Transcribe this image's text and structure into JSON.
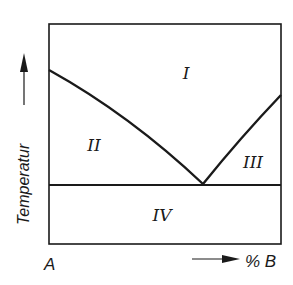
{
  "diagram": {
    "type": "binary-eutectic-phase-diagram",
    "y_axis": {
      "label": "Temperatur",
      "arrow": "up-arrow"
    },
    "x_axis": {
      "left_label": "A",
      "right_label": "% B",
      "arrow": "right-arrow"
    },
    "regions": [
      {
        "id": "I",
        "label": "I"
      },
      {
        "id": "II",
        "label": "II"
      },
      {
        "id": "III",
        "label": "III"
      },
      {
        "id": "IV",
        "label": "IV"
      }
    ],
    "colors": {
      "line": "#1a1a1a",
      "background": "#ffffff"
    }
  }
}
